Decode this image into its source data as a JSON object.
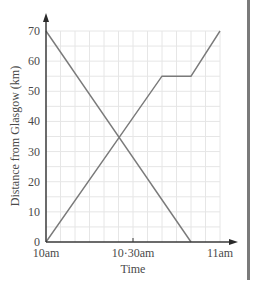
{
  "chart_data": {
    "type": "line",
    "title": "",
    "xlabel": "Time",
    "ylabel": "Distance from Glasgow (km)",
    "x_unit": "minutes after 10am",
    "xlim": [
      0,
      60
    ],
    "ylim": [
      0,
      70
    ],
    "x_ticks": [
      {
        "value": 0,
        "label": "10am"
      },
      {
        "value": 30,
        "label": "10·30am"
      },
      {
        "value": 60,
        "label": "11am"
      }
    ],
    "y_ticks": [
      0,
      10,
      20,
      30,
      40,
      50,
      60,
      70
    ],
    "grid": {
      "on": true,
      "x_minor_step": 5,
      "y_minor_step": 5
    },
    "legend": null,
    "series": [
      {
        "name": "journey-from-70km",
        "color": "#7a7a7a",
        "points": [
          {
            "x": 0,
            "y": 70
          },
          {
            "x": 50,
            "y": 0
          }
        ]
      },
      {
        "name": "journey-from-glasgow",
        "color": "#7a7a7a",
        "points": [
          {
            "x": 0,
            "y": 0
          },
          {
            "x": 40,
            "y": 55
          },
          {
            "x": 50,
            "y": 55
          },
          {
            "x": 60,
            "y": 70
          }
        ]
      }
    ],
    "annotations": []
  },
  "colors": {
    "axis": "#3a3a3a",
    "grid": "#e6e6e6",
    "line": "#7a7a7a",
    "side_bar": "#7a7a7a"
  }
}
